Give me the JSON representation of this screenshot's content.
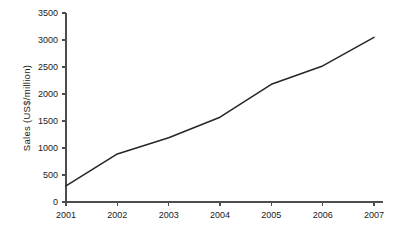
{
  "chart_data": {
    "type": "line",
    "title": "",
    "subtitle": "",
    "xlabel": "",
    "ylabel": "Sales (US$/million)",
    "categories": [
      "2001",
      "2002",
      "2003",
      "2004",
      "2005",
      "2006",
      "2007"
    ],
    "x": [
      2001,
      2002,
      2003,
      2004,
      2005,
      2006,
      2007
    ],
    "series": [
      {
        "name": "Sales",
        "values": [
          300,
          890,
          1190,
          1570,
          2180,
          2520,
          3050
        ]
      }
    ],
    "ylim": [
      0,
      3500
    ],
    "ytick_step": 500,
    "yticks": [
      0,
      500,
      1000,
      1500,
      2000,
      2500,
      3000,
      3500
    ],
    "ytick_labels": [
      "0",
      "500",
      "1000",
      "1500",
      "2000",
      "2500",
      "3000",
      "3500"
    ],
    "xtick_labels": [
      "2001",
      "2002",
      "2003",
      "2004",
      "2005",
      "2006",
      "2007"
    ],
    "grid": false,
    "legend": false,
    "legend_position": "none",
    "markers": false,
    "line_color": "#262626",
    "axis_color": "#4d4d4d",
    "background_color": "#ffffff",
    "annotations": []
  }
}
